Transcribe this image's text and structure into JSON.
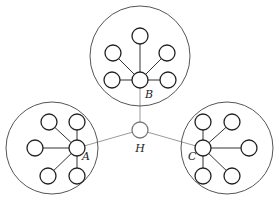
{
  "diagram": {
    "width": 279,
    "height": 205,
    "hub": {
      "label": "H",
      "x": 140,
      "y": 130,
      "r": 8,
      "label_x": 136,
      "label_y": 152
    },
    "clusters": [
      {
        "name": "B",
        "label": "B",
        "boundary": {
          "cx": 140,
          "cy": 56,
          "r": 50
        },
        "center": {
          "x": 140,
          "y": 80,
          "r": 8
        },
        "label_pos": {
          "x": 145,
          "y": 98
        },
        "leaves": [
          {
            "x": 140,
            "y": 36
          },
          {
            "x": 113,
            "y": 53
          },
          {
            "x": 167,
            "y": 53
          },
          {
            "x": 112,
            "y": 80
          },
          {
            "x": 168,
            "y": 80
          }
        ]
      },
      {
        "name": "A",
        "label": "A",
        "boundary": {
          "cx": 52,
          "cy": 148,
          "r": 46
        },
        "center": {
          "x": 77,
          "y": 148,
          "r": 8
        },
        "label_pos": {
          "x": 82,
          "y": 160
        },
        "leaves": [
          {
            "x": 49,
            "y": 122
          },
          {
            "x": 77,
            "y": 122
          },
          {
            "x": 35,
            "y": 148
          },
          {
            "x": 48,
            "y": 176
          },
          {
            "x": 77,
            "y": 176
          }
        ]
      },
      {
        "name": "C",
        "label": "C",
        "boundary": {
          "cx": 227,
          "cy": 148,
          "r": 46
        },
        "center": {
          "x": 203,
          "y": 148,
          "r": 8
        },
        "label_pos": {
          "x": 188,
          "y": 160
        },
        "leaves": [
          {
            "x": 203,
            "y": 122
          },
          {
            "x": 232,
            "y": 122
          },
          {
            "x": 249,
            "y": 148
          },
          {
            "x": 203,
            "y": 176
          },
          {
            "x": 232,
            "y": 176
          }
        ]
      }
    ],
    "leaf_radius": 8,
    "colors": {
      "node_stroke": "#222222",
      "boundary_stroke": "#555555",
      "hub_link": "#9a9a9a",
      "edge": "#333333"
    }
  }
}
